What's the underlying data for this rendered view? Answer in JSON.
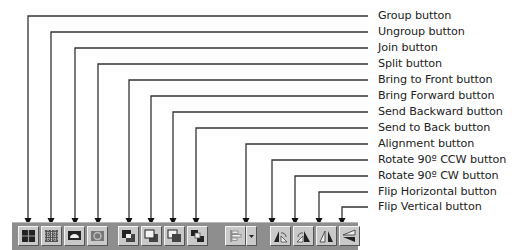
{
  "diagram": {
    "callouts": [
      {
        "label": "Group button",
        "icon": "group-icon"
      },
      {
        "label": "Ungroup button",
        "icon": "ungroup-icon"
      },
      {
        "label": "Join button",
        "icon": "join-icon"
      },
      {
        "label": "Split button",
        "icon": "split-icon"
      },
      {
        "label": "Bring to Front button",
        "icon": "bring-to-front-icon"
      },
      {
        "label": "Bring Forward button",
        "icon": "bring-forward-icon"
      },
      {
        "label": "Send Backward button",
        "icon": "send-backward-icon"
      },
      {
        "label": "Send to Back button",
        "icon": "send-to-back-icon"
      },
      {
        "label": "Alignment button",
        "icon": "alignment-icon"
      },
      {
        "label": "Rotate 90º CCW button",
        "icon": "rotate-ccw-icon"
      },
      {
        "label": "Rotate 90º CW button",
        "icon": "rotate-cw-icon"
      },
      {
        "label": "Flip Horizontal button",
        "icon": "flip-horizontal-icon"
      },
      {
        "label": "Flip Vertical button",
        "icon": "flip-vertical-icon"
      }
    ],
    "colors": {
      "line": "#333333",
      "toolbar": "#8e8e8e",
      "button": "#c9c9c9"
    }
  }
}
